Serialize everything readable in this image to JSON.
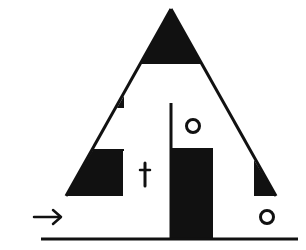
{
  "diagram": {
    "colors": {
      "ink": "#111111",
      "background": "#ffffff"
    },
    "labels": {
      "circle_upper": "o",
      "circle_lower": "o",
      "cross_mark": "t",
      "arrow": "→"
    },
    "elements": [
      {
        "name": "apex-fill",
        "type": "filled-triangle"
      },
      {
        "name": "triangle-outline",
        "type": "outline"
      },
      {
        "name": "left-notch",
        "type": "small-filled-triangle"
      },
      {
        "name": "left-base-block",
        "type": "filled-trapezoid"
      },
      {
        "name": "right-base-wedge",
        "type": "filled-triangle"
      },
      {
        "name": "center-divider",
        "type": "line"
      },
      {
        "name": "center-door-block",
        "type": "filled-rectangle"
      },
      {
        "name": "upper-circle-marker",
        "type": "circle"
      },
      {
        "name": "lower-circle-marker",
        "type": "circle"
      },
      {
        "name": "cross-mark",
        "type": "glyph"
      },
      {
        "name": "direction-arrow",
        "type": "arrow"
      },
      {
        "name": "ground-line",
        "type": "line"
      }
    ]
  }
}
